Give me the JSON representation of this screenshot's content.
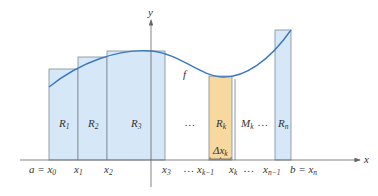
{
  "figure": {
    "colors": {
      "rect_fill": "#d6e7f7",
      "rect_stroke": "#7f8a96",
      "highlight_fill": "#f7d9a0",
      "highlight_stroke": "#7f8a96",
      "curve": "#3a78c3",
      "axis": "#666666",
      "text": "#333333"
    },
    "axes": {
      "x_label": "x",
      "y_label": "y"
    },
    "curve_label": "f",
    "rectangles": [
      {
        "id": "R1",
        "label": "R",
        "sub": "1"
      },
      {
        "id": "R2",
        "label": "R",
        "sub": "2"
      },
      {
        "id": "R3",
        "label": "R",
        "sub": "3"
      },
      {
        "id": "Rk",
        "label": "R",
        "sub": "k",
        "highlighted": true
      },
      {
        "id": "Rn",
        "label": "R",
        "sub": "n"
      }
    ],
    "between_labels": {
      "ellipsis_after_r3": "…",
      "mk_label": "M",
      "mk_sub": "k",
      "ellipsis_after_mk": "…",
      "delta_label": "Δx",
      "delta_sub": "k"
    },
    "tick_labels": [
      {
        "main": "a = x",
        "sub": "0"
      },
      {
        "main": "x",
        "sub": "1"
      },
      {
        "main": "x",
        "sub": "2"
      },
      {
        "main": "x",
        "sub": "3"
      },
      {
        "main": "…",
        "sub": ""
      },
      {
        "main": "x",
        "sub": "k−1"
      },
      {
        "main": "x",
        "sub": "k"
      },
      {
        "main": "…",
        "sub": ""
      },
      {
        "main": "x",
        "sub": "n−1"
      },
      {
        "main": "b = x",
        "sub": "n"
      }
    ]
  }
}
